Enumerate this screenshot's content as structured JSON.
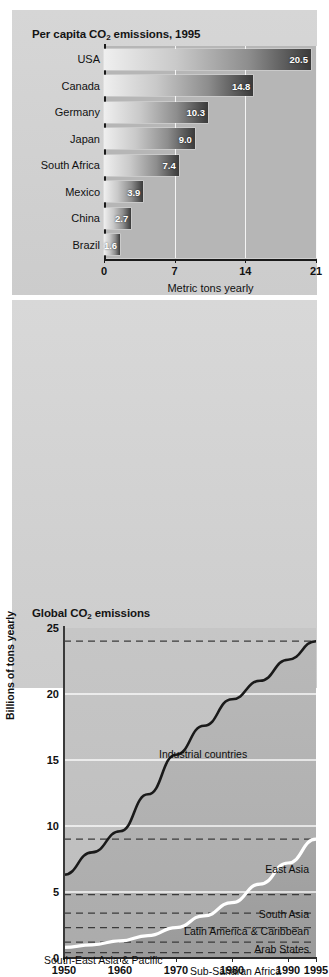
{
  "figure": {
    "panels": [
      {
        "id": "per-capita",
        "title_pre": "Per capita CO",
        "title_sub": "2",
        "title_post": " emissions, 1995"
      },
      {
        "id": "global",
        "title_pre": "Global CO",
        "title_sub": "2",
        "title_post": " emissions"
      }
    ]
  },
  "chart_data": [
    {
      "type": "bar",
      "title": "Per capita CO2 emissions, 1995",
      "orientation": "horizontal",
      "xlabel": "Metric tons yearly",
      "ylabel": "",
      "xlim": [
        0,
        21
      ],
      "xticks": [
        "0",
        "7",
        "14",
        "21"
      ],
      "xtick_values": [
        0,
        7,
        14,
        21
      ],
      "grid": true,
      "categories": [
        "USA",
        "Canada",
        "Germany",
        "Japan",
        "South Africa",
        "Mexico",
        "China",
        "Brazil"
      ],
      "values": [
        20.5,
        14.8,
        10.3,
        9.0,
        7.4,
        3.9,
        2.7,
        1.6
      ],
      "value_labels": [
        "20.5",
        "14.8",
        "10.3",
        "9.0",
        "7.4",
        "3.9",
        "2.7",
        "1.6"
      ],
      "bar_gradient": [
        "#efefef",
        "#3a3a3a"
      ]
    },
    {
      "type": "area",
      "title": "Global CO2 emissions",
      "xlabel": "",
      "ylabel": "Billions of tons yearly",
      "ylim": [
        0,
        25
      ],
      "yticks": [
        "0",
        "5",
        "10",
        "15",
        "20",
        "25"
      ],
      "ytick_values": [
        0,
        5,
        10,
        15,
        20,
        25
      ],
      "xlim": [
        1950,
        1995
      ],
      "xticks": [
        "1950",
        "1960",
        "1970",
        "1980",
        "1990",
        "1995"
      ],
      "xtick_values": [
        1950,
        1960,
        1970,
        1980,
        1990,
        1995
      ],
      "grid": true,
      "x": [
        1950,
        1955,
        1960,
        1965,
        1970,
        1975,
        1980,
        1985,
        1990,
        1995
      ],
      "series": [
        {
          "name": "Total (industrial + developing)",
          "label": "Industrial countries",
          "color": "#1a1a1a",
          "values": [
            6.3,
            8.0,
            9.6,
            12.4,
            15.4,
            17.6,
            19.6,
            21.0,
            22.6,
            24.0
          ]
        },
        {
          "name": "Developing regions total",
          "color": "#ffffff",
          "values": [
            0.8,
            1.0,
            1.3,
            1.7,
            2.3,
            3.2,
            4.2,
            5.6,
            7.2,
            9.0
          ]
        }
      ],
      "region_bands": [
        {
          "label": "East Asia",
          "dashed_level": 9.0
        },
        {
          "label": "South Asia",
          "dashed_level": 4.8
        },
        {
          "label": "Latin America & Caribbean",
          "dashed_level": 3.4
        },
        {
          "label": "Arab States",
          "dashed_level": 2.3
        },
        {
          "label": "South-East Asia & Pacific",
          "dashed_level": 1.2
        },
        {
          "label": "Sub-Saharan Africa",
          "dashed_level": 0.4
        }
      ],
      "top_dashed_level": 24.0
    }
  ]
}
